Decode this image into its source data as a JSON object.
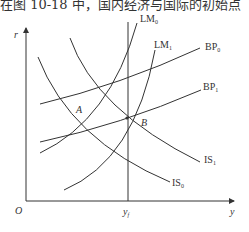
{
  "caption": "在图 10-18 中，国内经济与国际的初始点",
  "axes": {
    "y_label": "r",
    "x_label": "y",
    "origin_label": "O",
    "full_employment_label": "y",
    "full_employment_sub": "f"
  },
  "curves": {
    "lm0": {
      "name": "LM",
      "sub": "0"
    },
    "lm1": {
      "name": "LM",
      "sub": "1"
    },
    "bp0": {
      "name": "BP",
      "sub": "0"
    },
    "bp1": {
      "name": "BP",
      "sub": "1"
    },
    "is0": {
      "name": "IS",
      "sub": "0"
    },
    "is1": {
      "name": "IS",
      "sub": "1"
    }
  },
  "points": {
    "a": "A",
    "b": "B"
  },
  "colors": {
    "line": "#333333",
    "background": "#ffffff"
  }
}
